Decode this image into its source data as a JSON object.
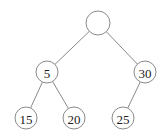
{
  "diagram": {
    "type": "binary-tree",
    "colors": {
      "stroke": "#8a8a8a",
      "fill": "#ffffff",
      "text": "#222222"
    },
    "nodes": [
      {
        "id": "root",
        "label": "",
        "x": 98,
        "y": 23,
        "r": 12
      },
      {
        "id": "n5",
        "label": "5",
        "x": 47,
        "y": 72,
        "r": 11
      },
      {
        "id": "n30",
        "label": "30",
        "x": 145,
        "y": 72,
        "r": 11
      },
      {
        "id": "n15",
        "label": "15",
        "x": 26,
        "y": 118,
        "r": 11
      },
      {
        "id": "n20",
        "label": "20",
        "x": 74,
        "y": 118,
        "r": 11
      },
      {
        "id": "n25",
        "label": "25",
        "x": 123,
        "y": 118,
        "r": 11
      }
    ],
    "edges": [
      {
        "from": "root",
        "to": "n5"
      },
      {
        "from": "root",
        "to": "n30"
      },
      {
        "from": "n5",
        "to": "n15"
      },
      {
        "from": "n5",
        "to": "n20"
      },
      {
        "from": "n30",
        "to": "n25"
      }
    ]
  }
}
